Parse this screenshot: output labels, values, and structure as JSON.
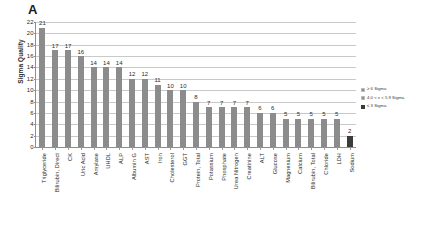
{
  "panel": {
    "label": "A"
  },
  "chart_data": {
    "type": "bar",
    "title": "",
    "xlabel": "",
    "ylabel": "Sigma Quality",
    "ylim": [
      0,
      22
    ],
    "ytick_step": 2,
    "yticks": [
      0,
      2,
      4,
      6,
      8,
      10,
      12,
      14,
      16,
      18,
      20,
      22
    ],
    "grid": true,
    "grid_axis": "y",
    "legend_position": "right",
    "bar_color": "#8c8c8c",
    "highlight_color": "#3b3b3b",
    "categories": [
      "Triglyceride",
      "Bilirubin, Direct",
      "CK",
      "Uric Acid",
      "Amylase",
      "UHDL",
      "ALP",
      "Albumin G",
      "AST",
      "Iron",
      "Cholesterol",
      "GGT",
      "Protein, Total",
      "Potassium",
      "Phosphate",
      "Urea Nitrogen",
      "Creatinine",
      "ALT",
      "Glucose",
      "Magnesium",
      "Calcium",
      "Bilirubin, Total",
      "Chloride",
      "LDH",
      "Sodium"
    ],
    "values": [
      21,
      17,
      17,
      16,
      14,
      14,
      14,
      12,
      12,
      11,
      10,
      10,
      8,
      7,
      7,
      7,
      7,
      6,
      6,
      5,
      5,
      5,
      5,
      5,
      2
    ],
    "data_labels": [
      "21",
      "17",
      "17",
      "16",
      "14",
      "14",
      "14",
      "12",
      "12",
      "11",
      "10",
      "10",
      "8",
      "7",
      "7",
      "7",
      "7",
      "6",
      "6",
      "5",
      "5",
      "5",
      "5",
      "5",
      "2"
    ],
    "bar_styles": [
      "normal",
      "normal",
      "normal",
      "normal",
      "normal",
      "normal",
      "normal",
      "normal",
      "normal",
      "normal",
      "normal",
      "normal",
      "normal",
      "normal",
      "normal",
      "normal",
      "normal",
      "normal",
      "normal",
      "normal",
      "normal",
      "normal",
      "normal",
      "normal",
      "dark"
    ],
    "legend": [
      {
        "label": "≥ 6 Sigma",
        "color": "#8c8c8c",
        "style": "normal"
      },
      {
        "label": "4.0 < x < 5.9 Sigma",
        "color": "#8c8c8c",
        "style": "mid"
      },
      {
        "label": "≤ 3 Sigma",
        "color": "#3b3b3b",
        "style": "dark"
      }
    ]
  }
}
